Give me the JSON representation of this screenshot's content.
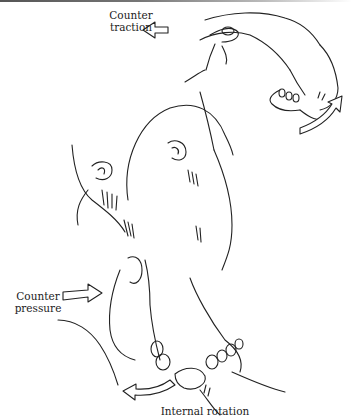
{
  "figure": {
    "labels": {
      "counter_traction": [
        "Counter",
        "traction"
      ],
      "counter_pressure": [
        "Counter",
        "pressure"
      ],
      "internal_rotation": "Internal rotation"
    },
    "arrows": [
      {
        "name": "counter-traction-arrow",
        "direction": "left"
      },
      {
        "name": "rotation-arrow-upper",
        "direction": "curved-up-right"
      },
      {
        "name": "counter-pressure-arrow",
        "direction": "right"
      },
      {
        "name": "internal-rotation-arrow",
        "direction": "curved-left"
      }
    ],
    "colors": {
      "line": "#222222",
      "background": "#ffffff"
    }
  }
}
